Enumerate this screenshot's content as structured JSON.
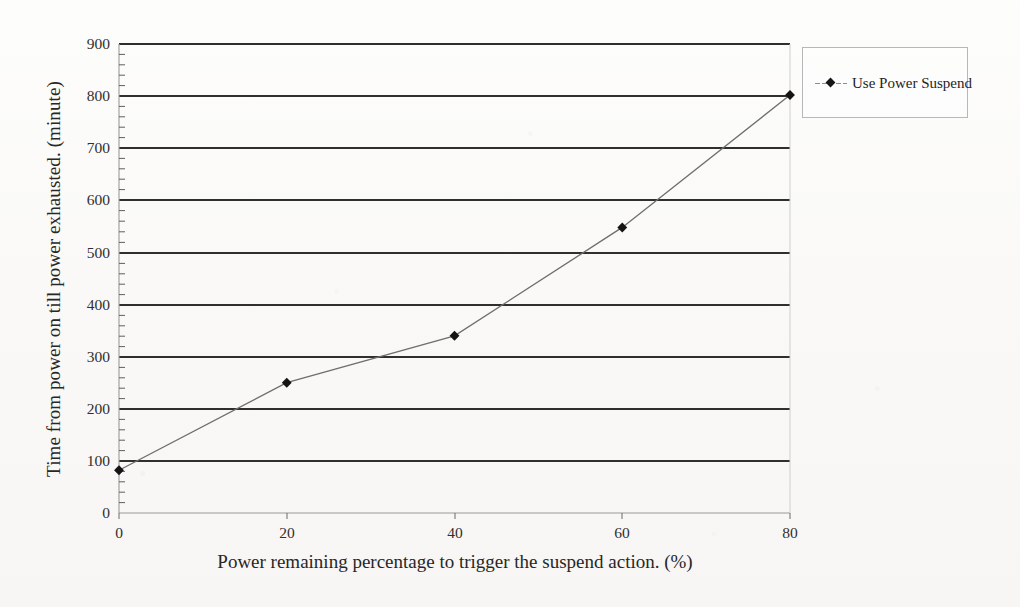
{
  "chart_data": {
    "type": "line",
    "title": "",
    "xlabel": "Power remaining percentage to trigger the suspend action.  (%)",
    "ylabel": "Time from power on till power exhausted. (minute)",
    "xlim": [
      0,
      80
    ],
    "ylim": [
      0,
      900
    ],
    "xticks": [
      0,
      20,
      40,
      60,
      80
    ],
    "yticks": [
      0,
      100,
      200,
      300,
      400,
      500,
      600,
      700,
      800,
      900
    ],
    "xtick_labels": [
      "0",
      "20",
      "40",
      "60",
      "80"
    ],
    "ytick_labels": [
      "0",
      "100",
      "200",
      "300",
      "400",
      "500",
      "600",
      "700",
      "800",
      "900"
    ],
    "grid": "horizontal",
    "minor_ticks_axis": "y",
    "legend_position": "right",
    "series": [
      {
        "name": "Use Power Suspend",
        "marker": "diamond",
        "color": "#6f6f6f",
        "marker_color": "#141414",
        "x": [
          0,
          20,
          40,
          60,
          80
        ],
        "values": [
          82,
          250,
          340,
          548,
          802
        ]
      }
    ]
  },
  "legend": {
    "entries": [
      {
        "label": "Use Power Suspend"
      }
    ]
  },
  "axes": {
    "y_title": "Time from power on till power exhausted. (minute)",
    "x_title": "Power remaining percentage to trigger the suspend action.  (%)"
  }
}
